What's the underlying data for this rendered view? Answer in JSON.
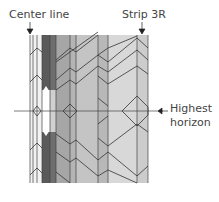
{
  "labels": {
    "center_line": "Center line",
    "strip": "Strip 3R",
    "horizon_1": "Highest",
    "horizon_2": "horizon"
  },
  "colors": {
    "line": "#333333",
    "darkest": "#555555",
    "dark": "#7a7a7a",
    "mid": "#a8a8a8",
    "light": "#c4c4c4",
    "lighter": "#d6d6d6",
    "lightest": "#e8e8e8"
  }
}
